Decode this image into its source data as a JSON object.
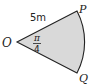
{
  "diagram": {
    "type": "circular-sector",
    "vertices": {
      "center": "O",
      "upper": "P",
      "lower": "Q"
    },
    "radius_label": "5m",
    "angle_label": {
      "numerator": "π",
      "denominator": "4"
    },
    "colors": {
      "fill": "#d9d9d9",
      "stroke": "#222222",
      "background": "#ffffff"
    }
  }
}
